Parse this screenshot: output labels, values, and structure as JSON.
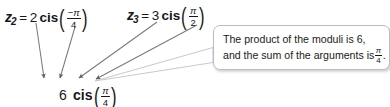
{
  "figure": {
    "type": "annotated-math-diagram",
    "background": "#ffffff",
    "text_color": "#1b1b1b",
    "arrow_color": "#6f6f6f",
    "callout_border_color": "#bcbcbc"
  },
  "expressions": {
    "z2": {
      "variable": "z",
      "subscript": "2",
      "equals": "=",
      "modulus": "2",
      "function": "cis",
      "paren_open": "(",
      "paren_close": ")",
      "numerator": "−π",
      "denominator": "4",
      "plain": "z2 = 2 cis(-π/4)"
    },
    "z3": {
      "variable": "z",
      "subscript": "3",
      "equals": "=",
      "modulus": "3",
      "function": "cis",
      "paren_open": "(",
      "paren_close": ")",
      "numerator": "π",
      "denominator": "2",
      "plain": "z3 = 3 cis(π/2)"
    },
    "product": {
      "modulus": "6",
      "function": "cis",
      "paren_open": "(",
      "paren_close": ")",
      "numerator": "π",
      "denominator": "4",
      "plain": "6 cis(π/4)"
    }
  },
  "callout": {
    "line1": "The product of the moduli is 6,",
    "line2_before": "and the sum of the arguments is",
    "line2_numerator": "π",
    "line2_denominator": "4",
    "line2_after": ".",
    "full_text": "The product of the moduli is 6, and the sum of the arguments is π/4."
  },
  "top_clipped_text": "z1z2  =  z3",
  "arrows": [
    {
      "name": "arrow-from-z2-modulus",
      "from": [
        36,
        22
      ],
      "to": [
        44,
        80
      ]
    },
    {
      "name": "arrow-from-z2-argument",
      "from": [
        74,
        26
      ],
      "to": [
        59,
        80
      ]
    },
    {
      "name": "arrow-from-z3-modulus",
      "from": [
        156,
        22
      ],
      "to": [
        77,
        80
      ]
    },
    {
      "name": "arrow-from-z3-argument",
      "from": [
        196,
        24
      ],
      "to": [
        93,
        80
      ]
    }
  ],
  "callout_tail": {
    "name": "callout-pointer-tail",
    "tip": [
      95,
      81
    ],
    "base_top": [
      213,
      48
    ],
    "base_bottom": [
      213,
      62
    ]
  }
}
